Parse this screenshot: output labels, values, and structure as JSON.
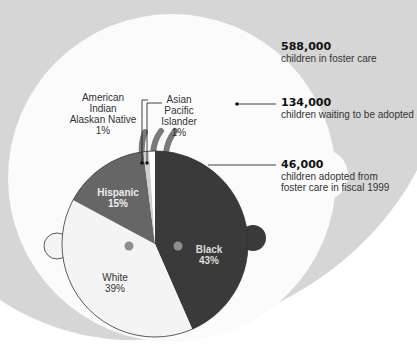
{
  "chart_data": {
    "type": "pie",
    "title": "",
    "slices": [
      {
        "label": "Black",
        "value": 43,
        "display": "43%",
        "color": "#3a3a3a"
      },
      {
        "label": "White",
        "value": 39,
        "display": "39%",
        "color": "#f4f4f4"
      },
      {
        "label": "Hispanic",
        "value": 15,
        "display": "15%",
        "color": "#666666"
      },
      {
        "label": "American Indian Alaskan Native",
        "value": 1,
        "display": "1%",
        "color": "#cfcfcf"
      },
      {
        "label": "Asian Pacific Islander",
        "value": 1,
        "display": "1%",
        "color": "#ffffff"
      }
    ],
    "nested_areas": [
      {
        "value": "588,000",
        "label": "children in foster care",
        "color": "#d6d6d6"
      },
      {
        "value": "134,000",
        "label": "children waiting to be adopted",
        "color": "#fbfbfb"
      },
      {
        "value": "46,000",
        "label": "children adopted from foster care in fiscal 1999",
        "color": "pie"
      }
    ]
  },
  "annotations": {
    "foster": {
      "value": "588,000",
      "line1": "children in foster care"
    },
    "waiting": {
      "value": "134,000",
      "line1": "children waiting to be adopted"
    },
    "adopted": {
      "value": "46,000",
      "line1": "children adopted from",
      "line2": "foster care in fiscal 1999"
    }
  },
  "pie_labels": {
    "american_indian": {
      "line1": "American Indian",
      "line2": "Alaskan Native",
      "pct": "1%"
    },
    "asian": {
      "line1": "Asian",
      "line2": "Pacific Islander",
      "pct": "1%"
    },
    "hispanic": {
      "name": "Hispanic",
      "pct": "15%"
    },
    "black": {
      "name": "Black",
      "pct": "43%"
    },
    "white": {
      "name": "White",
      "pct": "39%"
    }
  },
  "colors": {
    "background_outer": "#d6d6d6",
    "white_area": "#fbfbfb",
    "black_slice": "#3a3a3a",
    "hispanic_slice": "#666666",
    "hair": "#7a7a7a",
    "eyes": "#8e8e8e"
  }
}
